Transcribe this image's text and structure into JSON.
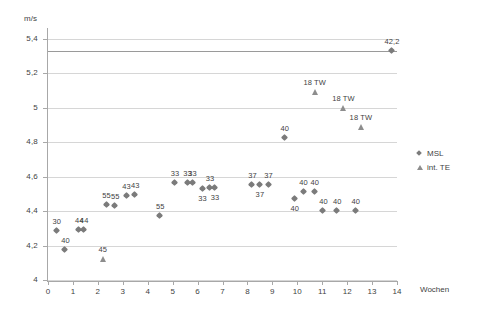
{
  "chart_data": {
    "type": "scatter",
    "title": "",
    "xlabel": "Wochen",
    "ylabel": "m/s",
    "xlim": [
      0,
      14
    ],
    "ylim": [
      4,
      5.45
    ],
    "grid": true,
    "legend_position": "right",
    "x_ticks": [
      "0",
      "1",
      "2",
      "3",
      "4",
      "5",
      "6",
      "7",
      "8",
      "9",
      "10",
      "11",
      "12",
      "13",
      "14"
    ],
    "y_ticks": [
      "4",
      "4,2",
      "4,4",
      "4,6",
      "4,8",
      "5",
      "5,2",
      "5,4"
    ],
    "reference_line": {
      "value": 5.33,
      "label": ""
    },
    "series": [
      {
        "name": "MSL",
        "marker": "diamond",
        "color": "#7b7b7b",
        "points": [
          {
            "x": 0.35,
            "y": 4.283,
            "label": "30",
            "label_pos": "above"
          },
          {
            "x": 0.7,
            "y": 4.175,
            "label": "40",
            "label_pos": "above"
          },
          {
            "x": 1.25,
            "y": 4.292,
            "label": "44",
            "label_pos": "above"
          },
          {
            "x": 1.45,
            "y": 4.292,
            "label": "44",
            "label_pos": "above"
          },
          {
            "x": 2.35,
            "y": 4.437,
            "label": "55",
            "label_pos": "above"
          },
          {
            "x": 2.7,
            "y": 4.43,
            "label": "55",
            "label_pos": "above"
          },
          {
            "x": 3.15,
            "y": 4.487,
            "label": "43",
            "label_pos": "above"
          },
          {
            "x": 3.5,
            "y": 4.492,
            "label": "43",
            "label_pos": "above"
          },
          {
            "x": 4.5,
            "y": 4.372,
            "label": "55",
            "label_pos": "above"
          },
          {
            "x": 5.1,
            "y": 4.562,
            "label": "33",
            "label_pos": "above"
          },
          {
            "x": 5.6,
            "y": 4.562,
            "label": "33",
            "label_pos": "above"
          },
          {
            "x": 5.8,
            "y": 4.562,
            "label": "33",
            "label_pos": "above"
          },
          {
            "x": 6.2,
            "y": 4.53,
            "label": "33",
            "label_pos": "below"
          },
          {
            "x": 6.5,
            "y": 4.533,
            "label": "33",
            "label_pos": "above"
          },
          {
            "x": 6.7,
            "y": 4.533,
            "label": "33",
            "label_pos": "below"
          },
          {
            "x": 8.2,
            "y": 4.552,
            "label": "37",
            "label_pos": "above"
          },
          {
            "x": 8.5,
            "y": 4.552,
            "label": "37",
            "label_pos": "below"
          },
          {
            "x": 8.85,
            "y": 4.552,
            "label": "37",
            "label_pos": "above"
          },
          {
            "x": 9.5,
            "y": 4.822,
            "label": "40",
            "label_pos": "above"
          },
          {
            "x": 9.9,
            "y": 4.468,
            "label": "40",
            "label_pos": "below"
          },
          {
            "x": 10.25,
            "y": 4.512,
            "label": "40",
            "label_pos": "above"
          },
          {
            "x": 10.7,
            "y": 4.508,
            "label": "40",
            "label_pos": "above"
          },
          {
            "x": 11.05,
            "y": 4.4,
            "label": "40",
            "label_pos": "above"
          },
          {
            "x": 11.6,
            "y": 4.4,
            "label": "40",
            "label_pos": "above"
          },
          {
            "x": 12.35,
            "y": 4.4,
            "label": "40",
            "label_pos": "above"
          },
          {
            "x": 13.8,
            "y": 5.33,
            "label": "42,2",
            "label_pos": "above"
          }
        ]
      },
      {
        "name": "int. TE",
        "marker": "triangle",
        "color": "#8d8d8d",
        "points": [
          {
            "x": 2.2,
            "y": 4.12,
            "label": "45",
            "label_pos": "above"
          },
          {
            "x": 10.7,
            "y": 5.092,
            "label": "18 TW",
            "label_pos": "above"
          },
          {
            "x": 11.85,
            "y": 4.995,
            "label": "18 TW",
            "label_pos": "above"
          },
          {
            "x": 12.55,
            "y": 4.885,
            "label": "18 TW",
            "label_pos": "above"
          }
        ]
      }
    ]
  },
  "legend": {
    "items": [
      {
        "label": "MSL",
        "marker": "diamond"
      },
      {
        "label": "int. TE",
        "marker": "triangle"
      }
    ]
  }
}
